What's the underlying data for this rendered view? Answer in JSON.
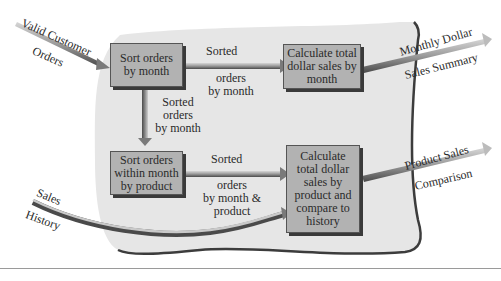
{
  "diagram": {
    "type": "data-flow",
    "title_fragment": "",
    "caption_fragment": "",
    "colors": {
      "region_fill": "#e6e6e6",
      "region_border": "#3c3c3c",
      "box_fill": "#b2b2b2",
      "box_border": "#555555",
      "box_shadow": "#3a3a3a",
      "arrow_dark": "#4a4a4a",
      "arrow_light": "#cfcfcf",
      "text": "#2a2a2a"
    },
    "processes": [
      {
        "id": "p1",
        "label": "Sort orders by month"
      },
      {
        "id": "p2",
        "label": "Calculate total dollar sales by month"
      },
      {
        "id": "p3",
        "label": "Sort orders within month by product"
      },
      {
        "id": "p4",
        "label": "Calculate total dollar sales by product and compare to history"
      }
    ],
    "inputs": [
      {
        "label_top": "Valid Customer",
        "label_bottom": "Orders"
      },
      {
        "label_top": "Sales",
        "label_bottom": "History"
      }
    ],
    "outputs": [
      {
        "label_top": "Monthly Dollar",
        "label_bottom": "Sales Summary"
      },
      {
        "label_top": "Product Sales",
        "label_bottom": "Comparison"
      }
    ],
    "flows": [
      {
        "from": "p1",
        "to": "p2",
        "label_line1": "Sorted",
        "label_line2": "orders",
        "label_line3": "by month"
      },
      {
        "from": "p1",
        "to": "p3",
        "label_line1": "Sorted",
        "label_line2": "orders",
        "label_line3": "by month"
      },
      {
        "from": "p3",
        "to": "p4",
        "label_line1": "Sorted",
        "label_line2": "orders",
        "label_line3": "by month &",
        "label_line4": "product"
      }
    ]
  }
}
